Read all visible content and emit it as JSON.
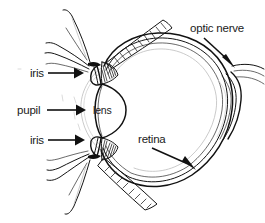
{
  "diagram": {
    "background_color": "#ffffff",
    "ink_color": "#111111",
    "labels": [
      {
        "id": "iris-top",
        "text": "iris",
        "text_x": 30,
        "text_y": 77,
        "leader_x1": 48,
        "leader_y1": 73,
        "leader_x2": 79,
        "leader_y2": 73,
        "arrow_dir": "right"
      },
      {
        "id": "pupil",
        "text": "pupil",
        "text_x": 17,
        "text_y": 114,
        "leader_x1": 47,
        "leader_y1": 110,
        "leader_x2": 81,
        "leader_y2": 110,
        "arrow_dir": "right"
      },
      {
        "id": "iris-bottom",
        "text": "iris",
        "text_x": 30,
        "text_y": 144,
        "leader_x1": 48,
        "leader_y1": 140,
        "leader_x2": 80,
        "leader_y2": 140,
        "arrow_dir": "right"
      },
      {
        "id": "lens",
        "text": "lens",
        "text_x": 93,
        "text_y": 114,
        "leader_x1": 0,
        "leader_y1": 0,
        "leader_x2": 0,
        "leader_y2": 0,
        "arrow_dir": "none"
      },
      {
        "id": "optic-nerve",
        "text": "optic nerve",
        "text_x": 190,
        "text_y": 32,
        "leader_x1": 205,
        "leader_y1": 38,
        "leader_x2": 233,
        "leader_y2": 63,
        "arrow_dir": "down-right"
      },
      {
        "id": "retina",
        "text": "retina",
        "text_x": 138,
        "text_y": 143,
        "leader_x1": 152,
        "leader_y1": 148,
        "leader_x2": 193,
        "leader_y2": 167,
        "arrow_dir": "down-right"
      }
    ],
    "structures": [
      {
        "id": "eyeball-wall",
        "name": "sclera-choroid-retina-wall"
      },
      {
        "id": "lens-body",
        "name": "crystalline-lens"
      },
      {
        "id": "cornea",
        "name": "cornea-arc"
      },
      {
        "id": "iris-upper",
        "name": "upper-iris-leaf"
      },
      {
        "id": "iris-lower",
        "name": "lower-iris-leaf"
      },
      {
        "id": "ciliary-upper",
        "name": "upper-ciliary-body"
      },
      {
        "id": "ciliary-lower",
        "name": "lower-ciliary-body"
      },
      {
        "id": "muscle-upper",
        "name": "superior-rectus-muscle"
      },
      {
        "id": "muscle-lower",
        "name": "inferior-rectus-muscle"
      },
      {
        "id": "eyelid-upper",
        "name": "upper-eyelid-lashes"
      },
      {
        "id": "eyelid-lower",
        "name": "lower-eyelid-lashes"
      },
      {
        "id": "optic-nerve-bundle",
        "name": "optic-nerve-bundle"
      }
    ]
  }
}
